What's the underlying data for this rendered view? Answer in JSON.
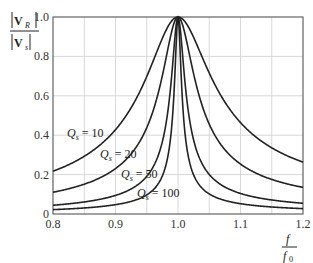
{
  "chart_data": {
    "type": "line",
    "title": "",
    "xlabel": "f / f0",
    "ylabel": "|V_R| / |V_s|",
    "xlim": [
      0.8,
      1.2
    ],
    "ylim": [
      0,
      1.0
    ],
    "grid": true,
    "x_ticks": [
      "0.8",
      "0.9",
      "1.0",
      "1.1",
      "1.2"
    ],
    "y_ticks": [
      "0",
      "0.2",
      "0.4",
      "0.6",
      "0.8",
      "1.0"
    ],
    "x": [
      0.8,
      0.85,
      0.9,
      0.95,
      0.98,
      1.0,
      1.02,
      1.05,
      1.1,
      1.15,
      1.2
    ],
    "series": [
      {
        "name": "Q_s = 10",
        "values": [
          0.22,
          0.3,
          0.43,
          0.69,
          0.93,
          1.0,
          0.93,
          0.71,
          0.46,
          0.33,
          0.26
        ]
      },
      {
        "name": "Q_s = 20",
        "values": [
          0.11,
          0.15,
          0.23,
          0.46,
          0.78,
          1.0,
          0.78,
          0.46,
          0.25,
          0.17,
          0.13
        ]
      },
      {
        "name": "Q_s = 50",
        "values": [
          0.045,
          0.06,
          0.09,
          0.19,
          0.45,
          1.0,
          0.45,
          0.2,
          0.1,
          0.07,
          0.055
        ]
      },
      {
        "name": "Q_s = 100",
        "values": [
          0.022,
          0.03,
          0.047,
          0.1,
          0.24,
          1.0,
          0.24,
          0.1,
          0.05,
          0.035,
          0.027
        ]
      }
    ],
    "annotations": [
      {
        "text_q": "Q",
        "sub": "s",
        "rest": " = 10",
        "x": 67,
        "y": 137
      },
      {
        "text_q": "Q",
        "sub": "s",
        "rest": " = 20",
        "x": 100,
        "y": 158
      },
      {
        "text_q": "Q",
        "sub": "s",
        "rest": " = 50",
        "x": 121,
        "y": 178
      },
      {
        "text_q": "Q",
        "sub": "s",
        "rest": " = 100",
        "x": 137,
        "y": 197
      }
    ],
    "q_values": [
      10,
      20,
      50,
      100
    ]
  },
  "labels": {
    "y_num": "V",
    "y_num_sub": "R",
    "y_den": "V",
    "y_den_sub": "s",
    "x_num": "f",
    "x_den": "f",
    "x_den_sub": "0"
  }
}
